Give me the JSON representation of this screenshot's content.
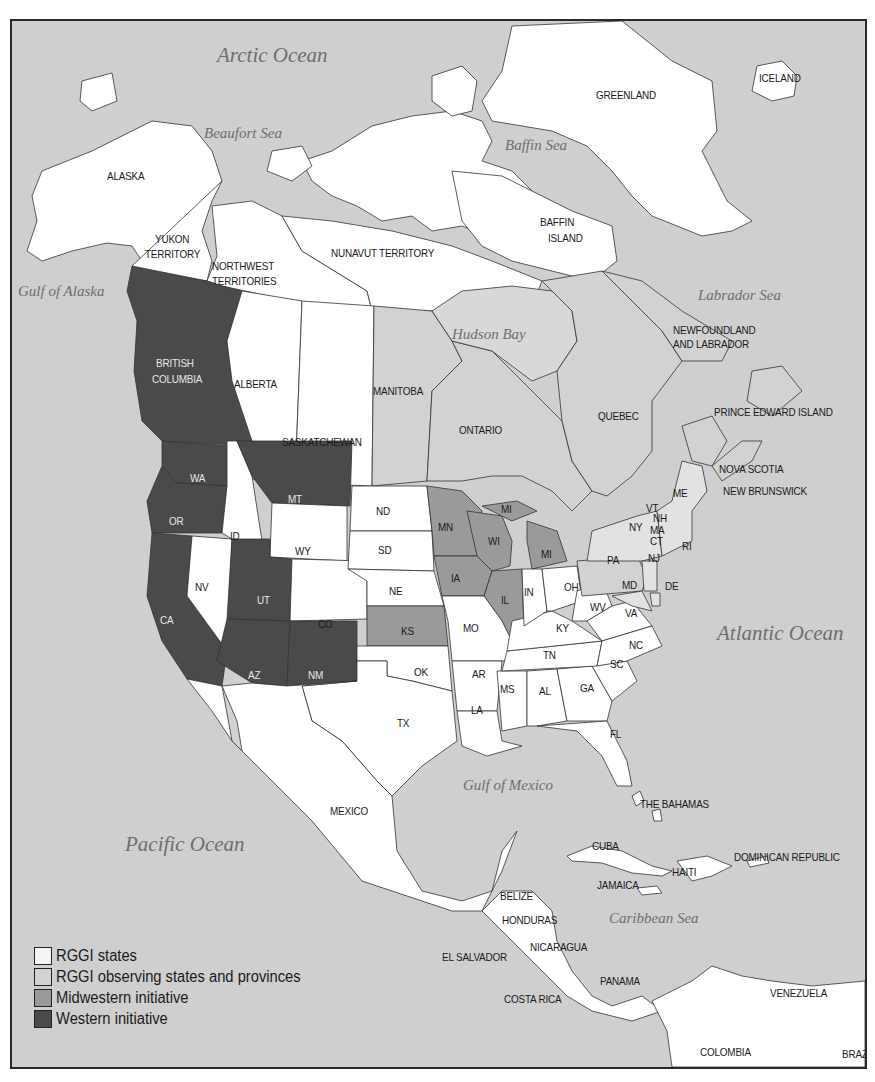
{
  "colors": {
    "water": "#cfcfcf",
    "rggi": "#ffffff",
    "observing": "#dedede",
    "midwestern": "#9a9a9a",
    "western": "#4a4a4a",
    "border": "#333333"
  },
  "oceans": {
    "arctic": "Arctic Ocean",
    "beaufort": "Beaufort Sea",
    "baffin": "Baffin Sea",
    "gulf_alaska": "Gulf of Alaska",
    "labrador": "Labrador Sea",
    "hudson": "Hudson Bay",
    "atlantic": "Atlantic Ocean",
    "gulf_mexico": "Gulf of Mexico",
    "pacific": "Pacific Ocean",
    "caribbean": "Caribbean Sea"
  },
  "regions": {
    "alaska": "ALASKA",
    "yukon_1": "YUKON",
    "yukon_2": "TERRITORY",
    "nwt_1": "NORTHWEST",
    "nwt_2": "TERRITORIES",
    "nunavut": "NUNAVUT TERRITORY",
    "greenland": "GREENLAND",
    "iceland": "ICELAND",
    "baffin_1": "BAFFIN",
    "baffin_2": "ISLAND",
    "bc_1": "BRITISH",
    "bc_2": "COLUMBIA",
    "alberta": "ALBERTA",
    "saskatchewan": "SASKATCHEWAN",
    "manitoba": "MANITOBA",
    "ontario": "ONTARIO",
    "quebec": "QUEBEC",
    "newfoundland_1": "NEWFOUNDLAND",
    "newfoundland_2": "AND LABRADOR",
    "pei": "PRINCE EDWARD ISLAND",
    "nova_scotia": "NOVA SCOTIA",
    "new_brunswick": "NEW BRUNSWICK",
    "mexico": "MEXICO",
    "bahamas": "THE BAHAMAS",
    "cuba": "CUBA",
    "haiti": "HAITI",
    "dominican": "DOMINICAN REPUBLIC",
    "jamaica": "JAMAICA",
    "belize": "BELIZE",
    "honduras": "HONDURAS",
    "el_salvador": "EL SALVADOR",
    "nicaragua": "NICARAGUA",
    "costa_rica": "COSTA RICA",
    "panama": "PANAMA",
    "venezuela": "VENEZUELA",
    "colombia": "COLOMBIA",
    "brazil": "BRAZIL"
  },
  "states": {
    "WA": "WA",
    "OR": "OR",
    "CA": "CA",
    "ID": "ID",
    "NV": "NV",
    "MT": "MT",
    "WY": "WY",
    "UT": "UT",
    "AZ": "AZ",
    "CO": "CO",
    "NM": "NM",
    "ND": "ND",
    "SD": "SD",
    "NE": "NE",
    "KS": "KS",
    "OK": "OK",
    "TX": "TX",
    "MN": "MN",
    "IA": "IA",
    "MO": "MO",
    "AR": "AR",
    "LA": "LA",
    "WI": "WI",
    "IL": "IL",
    "MI_UP": "MI",
    "MI": "MI",
    "IN": "IN",
    "OH": "OH",
    "KY": "KY",
    "TN": "TN",
    "MS": "MS",
    "AL": "AL",
    "GA": "GA",
    "FL": "FL",
    "SC": "SC",
    "NC": "NC",
    "VA": "VA",
    "WV": "WV",
    "PA": "PA",
    "NY": "NY",
    "MD": "MD",
    "DE": "DE",
    "NJ": "NJ",
    "CT": "CT",
    "RI": "RI",
    "MA": "MA",
    "VT": "VT",
    "NH": "NH",
    "ME": "ME"
  },
  "legend": {
    "items": [
      {
        "label": "RGGI states",
        "color": "#f4f4f4"
      },
      {
        "label": "RGGI observing states and provinces",
        "color": "#d2d2d2"
      },
      {
        "label": "Midwestern initiative",
        "color": "#9a9a9a"
      },
      {
        "label": "Western initiative",
        "color": "#4a4a4a"
      }
    ]
  }
}
